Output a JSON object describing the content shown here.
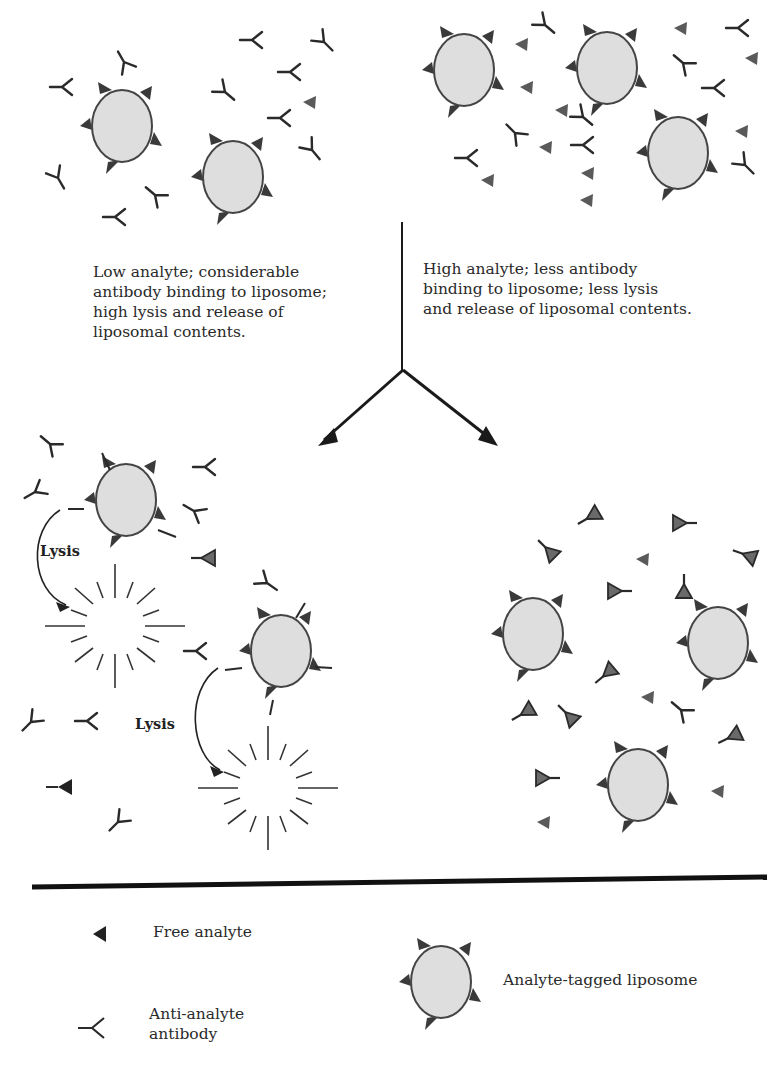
{
  "colors": {
    "liposome_fill": "#dedede",
    "liposome_stroke": "#444444",
    "analyte": "#555555",
    "antibody": "#2a2a2a",
    "divider": "#111111"
  },
  "captions": {
    "low_analyte": "Low analyte; considerable\nantibody binding to liposome;\nhigh lysis and release of\nliposomal contents.",
    "high_analyte": "High analyte; less antibody\nbinding to liposome; less lysis\nand release of liposomal contents."
  },
  "lysis_labels": [
    "Lysis",
    "Lysis"
  ],
  "legend": {
    "free_analyte": "Free analyte",
    "antibody": "Anti-analyte\nantibody",
    "liposome": "Analyte-tagged liposome"
  },
  "icons": {
    "liposome": "analyte-tagged-liposome-icon",
    "analyte": "free-analyte-icon",
    "antibody": "anti-analyte-antibody-icon",
    "lysis": "lysis-burst-icon",
    "arrow": "branch-arrow-icon"
  }
}
